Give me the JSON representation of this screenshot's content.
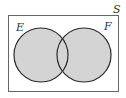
{
  "diagram": {
    "type": "venn",
    "universe_label": "S",
    "sets": [
      {
        "label": "E",
        "shaded": true
      },
      {
        "label": "F",
        "shaded": true
      }
    ],
    "colors": {
      "fill": "#d4d4d4",
      "stroke": "#2a2a2a",
      "frame": "#555555",
      "background": "#ffffff"
    }
  }
}
